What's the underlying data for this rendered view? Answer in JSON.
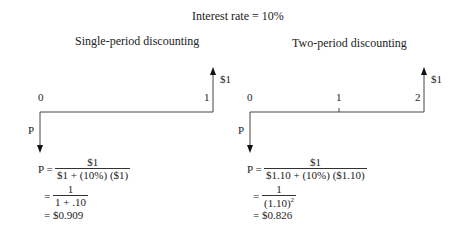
{
  "title": "Interest rate = 10%",
  "left": {
    "subtitle": "Single-period discounting",
    "timeline_labels": [
      "0",
      "1"
    ],
    "cash_in_label": "$1",
    "present_label": "P",
    "equation": {
      "lhs": "P =",
      "line1_num": "$1",
      "line1_den": "$1 + (10%) ($1)",
      "eq2": "=",
      "line2_num": "1",
      "line2_den": "1 + .10",
      "eq3": "= $0.909"
    }
  },
  "right": {
    "subtitle": "Two-period discounting",
    "timeline_labels": [
      "0",
      "1",
      "2"
    ],
    "cash_in_label": "$1",
    "present_label": "P",
    "equation": {
      "lhs": "P =",
      "line1_num": "$1",
      "line1_den": "$1.10 + (10%) ($1.10)",
      "eq2": "=",
      "line2_num": "1",
      "line2_den_base": "(1.10)",
      "line2_den_exp": "2",
      "eq3": "= $0.826"
    }
  }
}
